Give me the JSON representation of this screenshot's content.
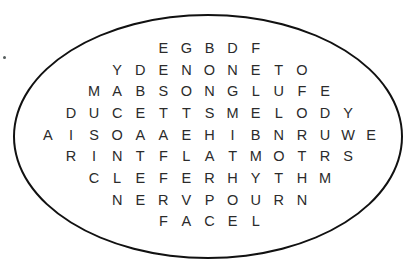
{
  "puzzle": {
    "type": "word-search",
    "shape": "oval",
    "border_color": "#111111",
    "letter_color": "#2b2b2b",
    "background_color": "#ffffff",
    "row_count": 9,
    "max_row_length": 15,
    "rows": [
      {
        "index": 1,
        "length": 5,
        "letters": [
          "E",
          "G",
          "B",
          "D",
          "F"
        ]
      },
      {
        "index": 2,
        "length": 9,
        "letters": [
          "Y",
          "D",
          "E",
          "N",
          "O",
          "N",
          "E",
          "T",
          "O"
        ]
      },
      {
        "index": 3,
        "length": 11,
        "letters": [
          "M",
          "A",
          "B",
          "S",
          "O",
          "N",
          "G",
          "L",
          "U",
          "F",
          "E"
        ]
      },
      {
        "index": 4,
        "length": 13,
        "letters": [
          "D",
          "U",
          "C",
          "E",
          "T",
          "T",
          "S",
          "M",
          "E",
          "L",
          "O",
          "D",
          "Y"
        ]
      },
      {
        "index": 5,
        "length": 15,
        "letters": [
          "A",
          "I",
          "S",
          "O",
          "A",
          "A",
          "E",
          "H",
          "I",
          "B",
          "N",
          "R",
          "U",
          "W",
          "E"
        ]
      },
      {
        "index": 6,
        "length": 13,
        "letters": [
          "R",
          "I",
          "N",
          "T",
          "F",
          "L",
          "A",
          "T",
          "M",
          "O",
          "T",
          "R",
          "S"
        ]
      },
      {
        "index": 7,
        "length": 11,
        "letters": [
          "C",
          "L",
          "E",
          "F",
          "E",
          "R",
          "H",
          "Y",
          "T",
          "H",
          "M"
        ]
      },
      {
        "index": 8,
        "length": 9,
        "letters": [
          "N",
          "E",
          "R",
          "V",
          "P",
          "O",
          "U",
          "R",
          "N"
        ]
      },
      {
        "index": 9,
        "length": 5,
        "letters": [
          "F",
          "A",
          "C",
          "E",
          "L"
        ]
      }
    ],
    "row_strings": [
      "E G B D F",
      "Y D E N O N E T O",
      "M A B S O N G L U F E",
      "D U C E T T S M E L O D Y",
      "A I S O A A E H I B N R U W E",
      "R I N T F L A T M O T R S",
      "C L E F E R H Y T H M",
      "N E R V P O U R N",
      "F A C E L"
    ]
  },
  "marks": {
    "stray_dot": "ink-speck"
  }
}
